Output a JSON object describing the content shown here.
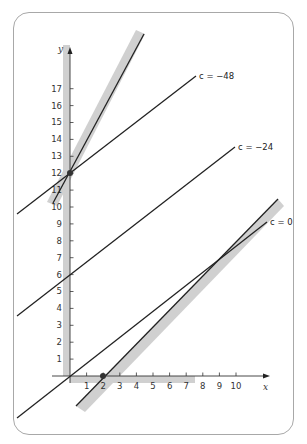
{
  "diagram": {
    "x_axis": {
      "label": "x",
      "ticks": [
        "1",
        "2",
        "3",
        "4",
        "5",
        "6",
        "7",
        "8",
        "9",
        "10"
      ]
    },
    "y_axis": {
      "label": "y",
      "ticks": [
        "1",
        "2",
        "3",
        "4",
        "5",
        "6",
        "7",
        "8",
        "9",
        "10",
        "11",
        "12",
        "13",
        "14",
        "15",
        "16",
        "17"
      ]
    },
    "level_lines": [
      {
        "label": "c = 0"
      },
      {
        "label": "c = −24"
      },
      {
        "label": "c = −48"
      }
    ],
    "points": [
      {
        "x": 0,
        "y": 12
      },
      {
        "x": 2,
        "y": 0
      }
    ],
    "colors": {
      "line": "#222222",
      "band": "#d0d0d0",
      "frame": "#a8a8a8"
    }
  }
}
